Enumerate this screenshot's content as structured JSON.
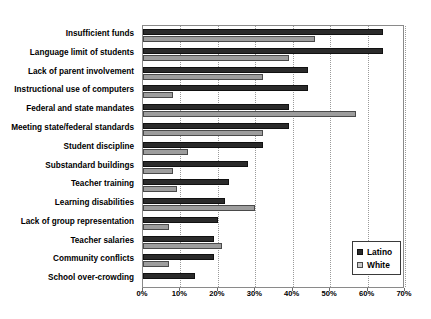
{
  "chart_data": {
    "type": "bar",
    "orientation": "horizontal",
    "title": "",
    "xlabel": "",
    "ylabel": "",
    "xlim": [
      0,
      70
    ],
    "xtick_labels": [
      "0%",
      "10%",
      "20%",
      "30%",
      "40%",
      "50%",
      "60%",
      "70%"
    ],
    "xticks": [
      0,
      10,
      20,
      30,
      40,
      50,
      60,
      70
    ],
    "grid": "vertical-dotted",
    "legend_position": "lower-right-inside",
    "categories": [
      "Insufficient funds",
      "Language limit of students",
      "Lack of parent involvement",
      "Instructional use of computers",
      "Federal and state mandates",
      "Meeting state/federal standards",
      "Student discipline",
      "Substandard buildings",
      "Teacher training",
      "Learning disabilities",
      "Lack of group representation",
      "Teacher salaries",
      "Community conflicts",
      "School over-crowding"
    ],
    "series": [
      {
        "name": "Latino",
        "color": "#2b2b2b",
        "values": [
          64,
          64,
          44,
          44,
          39,
          39,
          32,
          28,
          23,
          22,
          20,
          19,
          19,
          14
        ]
      },
      {
        "name": "White",
        "color": "#9d9d9d",
        "values": [
          46,
          39,
          32,
          8,
          57,
          32,
          12,
          8,
          9,
          30,
          7,
          21,
          7,
          0
        ]
      }
    ]
  },
  "legend": {
    "items": [
      {
        "label": "Latino",
        "swatch": "dark-square-swatch"
      },
      {
        "label": "White",
        "swatch": "light-square-swatch"
      }
    ]
  }
}
